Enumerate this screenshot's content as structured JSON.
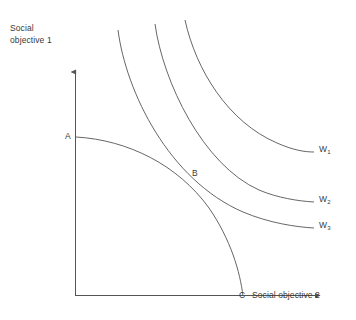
{
  "figure": {
    "type": "economics-diagram",
    "background_color": "#ffffff",
    "line_color": "#555555",
    "text_color": "#3a3a3a"
  },
  "axes": {
    "y_title": "Social\nobjective 1",
    "x_title": "Social objective 2",
    "origin_label": "",
    "y_axis_arrow": "up-arrow",
    "x_axis_arrow": "right-arrow"
  },
  "points": {
    "a": {
      "label": "A",
      "x": 76,
      "y": 137
    },
    "b": {
      "label": "B",
      "x": 192,
      "y": 180
    },
    "c": {
      "label": "C",
      "x": 243,
      "y": 296
    }
  },
  "curves": {
    "ppf": {
      "name": "production-possibility-frontier",
      "path": "M 76 137 C 128 140 178 165 209 208 C 231 240 240 272 243 296"
    },
    "w1": {
      "label": "W",
      "subscript": "1",
      "path": "M 185 20 C 196 70 228 122 277 143 C 293 150 304 152 314 152"
    },
    "w2": {
      "label": "W",
      "subscript": "2",
      "path": "M 155 24 C 163 82 203 165 259 190 C 278 198 298 201 314 202"
    },
    "w3": {
      "label": "W",
      "subscript": "3",
      "path": "M 118 30 C 126 92 169 180 243 212 C 269 223 296 227 314 228"
    }
  },
  "chart_data": {
    "type": "line",
    "title": "",
    "xlabel": "Social objective 2",
    "ylabel": "Social objective 1",
    "annotations": [
      {
        "text": "A",
        "meaning": "ppf-intercept-on-y-axis"
      },
      {
        "text": "B",
        "meaning": "tangency-point-ppf-and-w2"
      },
      {
        "text": "C",
        "meaning": "ppf-intercept-on-x-axis"
      }
    ],
    "series": [
      {
        "name": "Production possibility frontier",
        "kind": "concave-frontier",
        "from": "A",
        "to": "C"
      },
      {
        "name": "W1",
        "kind": "indifference-curve",
        "level": "highest-unattainable"
      },
      {
        "name": "W2",
        "kind": "indifference-curve",
        "level": "optimum-tangent-at-B"
      },
      {
        "name": "W3",
        "kind": "indifference-curve",
        "level": "lowest-attainable"
      }
    ],
    "grid": false,
    "legend": "inline-right-of-curves"
  }
}
